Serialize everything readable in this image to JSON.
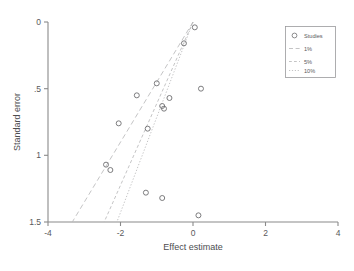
{
  "chart_data": {
    "type": "scatter",
    "title": "",
    "subtitle": "",
    "xlabel": "Effect estimate",
    "ylabel": "Standard error",
    "xlim": [
      -4,
      4
    ],
    "ylim": [
      1.5,
      0
    ],
    "y_inverted": true,
    "grid": false,
    "xticks": [
      -4,
      -2,
      0,
      2,
      4
    ],
    "xticklabels": [
      "-4",
      "-2",
      "0",
      "2",
      "4"
    ],
    "yticks": [
      0,
      0.5,
      1,
      1.5
    ],
    "yticklabels": [
      "0",
      ".5",
      "1",
      "1.5"
    ],
    "legend_position": "upper right",
    "legend_entries": [
      {
        "label": "Studies",
        "marker": "circle-open"
      },
      {
        "label": "1%",
        "marker": "dashed-line"
      },
      {
        "label": "5%",
        "marker": "dashed-line"
      },
      {
        "label": "10%",
        "marker": "dotted-line"
      }
    ],
    "series": [
      {
        "name": "Studies",
        "marker": "circle-open",
        "points": [
          {
            "x": 0.05,
            "y": 0.04
          },
          {
            "x": -0.25,
            "y": 0.16
          },
          {
            "x": -1.0,
            "y": 0.46
          },
          {
            "x": 0.22,
            "y": 0.5
          },
          {
            "x": -1.55,
            "y": 0.55
          },
          {
            "x": -0.65,
            "y": 0.57
          },
          {
            "x": -0.85,
            "y": 0.63
          },
          {
            "x": -0.8,
            "y": 0.65
          },
          {
            "x": -2.05,
            "y": 0.76
          },
          {
            "x": -1.25,
            "y": 0.8
          },
          {
            "x": -2.4,
            "y": 1.07
          },
          {
            "x": -2.28,
            "y": 1.11
          },
          {
            "x": -1.3,
            "y": 1.28
          },
          {
            "x": -0.85,
            "y": 1.32
          },
          {
            "x": 0.15,
            "y": 1.45
          }
        ]
      }
    ],
    "contours": [
      {
        "name": "1%",
        "style": "dashed",
        "apex": {
          "x": 0.0,
          "y": 0.0
        },
        "left_end": {
          "x": -3.33,
          "y": 1.5
        },
        "z": 2.58
      },
      {
        "name": "5%",
        "style": "dashed",
        "apex": {
          "x": 0.0,
          "y": 0.0
        },
        "left_end": {
          "x": -2.45,
          "y": 1.5
        },
        "z": 1.96
      },
      {
        "name": "10%",
        "style": "dotted",
        "apex": {
          "x": 0.0,
          "y": 0.0
        },
        "left_end": {
          "x": -2.1,
          "y": 1.5
        },
        "z": 1.645
      }
    ],
    "colors": {
      "marker": "#6e6e70",
      "axis": "#8a8a8a",
      "contour": "#b9b9bb",
      "text": "#59595b",
      "background": "#ffffff"
    }
  }
}
